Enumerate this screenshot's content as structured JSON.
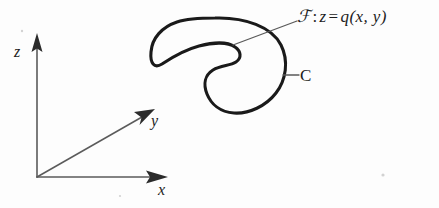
{
  "figure": {
    "background_color": "#fdfdfd",
    "curve_color": "#1a1a1a",
    "axis_color": "#5b5b5b",
    "text_color": "#1d1d1d"
  },
  "axes": {
    "z": {
      "label": "z",
      "direction": "up"
    },
    "y": {
      "label": "y",
      "direction": "up-right"
    },
    "x": {
      "label": "x",
      "direction": "right"
    },
    "origin": {
      "x": 37,
      "y": 177
    }
  },
  "annotations": {
    "curve": {
      "label": "C",
      "description": "closed bean-shaped curve"
    },
    "surface": {
      "symbol": "ℱ",
      "separator": ":",
      "variable": "z",
      "equals": "=",
      "function": "q(x, y)",
      "full": "ℱ : z = q(x, y)"
    }
  }
}
